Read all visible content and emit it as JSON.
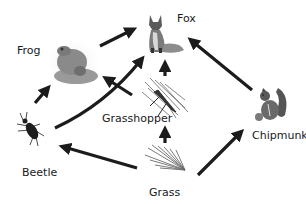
{
  "diagram": {
    "type": "food-web",
    "nodes": [
      {
        "id": "fox",
        "label": "Fox",
        "icon": "fox-icon"
      },
      {
        "id": "frog",
        "label": "Frog",
        "icon": "frog-icon"
      },
      {
        "id": "grasshopper",
        "label": "Grasshopper",
        "icon": "grasshopper-icon"
      },
      {
        "id": "beetle",
        "label": "Beetle",
        "icon": "beetle-icon"
      },
      {
        "id": "chipmunk",
        "label": "Chipmunk",
        "icon": "chipmunk-icon"
      },
      {
        "id": "grass",
        "label": "Grass",
        "icon": "grass-icon"
      }
    ],
    "edges": [
      {
        "from": "frog",
        "to": "fox"
      },
      {
        "from": "beetle",
        "to": "frog"
      },
      {
        "from": "beetle",
        "to": "fox"
      },
      {
        "from": "grasshopper",
        "to": "frog"
      },
      {
        "from": "grasshopper",
        "to": "fox"
      },
      {
        "from": "grass",
        "to": "grasshopper"
      },
      {
        "from": "grass",
        "to": "beetle"
      },
      {
        "from": "grass",
        "to": "chipmunk"
      },
      {
        "from": "chipmunk",
        "to": "fox"
      }
    ],
    "colors": {
      "arrow": "#1c1c1c",
      "text": "#1a1a1a",
      "background": "#ffffff"
    }
  }
}
